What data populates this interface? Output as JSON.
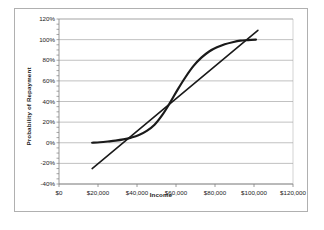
{
  "chart_data": {
    "type": "line",
    "title": "",
    "xlabel": "Income",
    "ylabel": "Probability of Repayment",
    "xlim": [
      0,
      120000
    ],
    "ylim": [
      -0.4,
      1.2
    ],
    "grid": true,
    "legend": "none",
    "x_ticks": [
      {
        "value": 0,
        "label": "$0"
      },
      {
        "value": 20000,
        "label": "$20,000"
      },
      {
        "value": 40000,
        "label": "$40,000"
      },
      {
        "value": 60000,
        "label": "$60,000"
      },
      {
        "value": 80000,
        "label": "$80,000"
      },
      {
        "value": 100000,
        "label": "$100,000"
      },
      {
        "value": 120000,
        "label": "$120,000"
      }
    ],
    "y_ticks": [
      {
        "value": 1.2,
        "label": "120%"
      },
      {
        "value": 1.0,
        "label": "100%"
      },
      {
        "value": 0.8,
        "label": "80%"
      },
      {
        "value": 0.6,
        "label": "60%"
      },
      {
        "value": 0.4,
        "label": "40%"
      },
      {
        "value": 0.2,
        "label": "20%"
      },
      {
        "value": 0.0,
        "label": "0%"
      },
      {
        "value": -0.2,
        "label": "-20%"
      },
      {
        "value": -0.4,
        "label": "-40%"
      }
    ],
    "series": [
      {
        "name": "logistic-curve",
        "type": "line",
        "color": "#1a1a1a",
        "width": 2.2,
        "x": [
          17000,
          21000,
          25000,
          29000,
          33000,
          37000,
          41000,
          45000,
          49000,
          53000,
          57000,
          61000,
          65000,
          69000,
          73000,
          77000,
          81000,
          85000,
          89000,
          93000,
          97000,
          101000
        ],
        "values": [
          0.0,
          0.005,
          0.012,
          0.02,
          0.032,
          0.05,
          0.075,
          0.115,
          0.175,
          0.27,
          0.39,
          0.52,
          0.64,
          0.745,
          0.825,
          0.885,
          0.925,
          0.955,
          0.975,
          0.99,
          0.995,
          1.0
        ]
      },
      {
        "name": "linear-fit",
        "type": "line",
        "color": "#1a1a1a",
        "width": 1.6,
        "x": [
          17000,
          102000
        ],
        "values": [
          -0.25,
          1.09
        ]
      }
    ]
  },
  "figure": {
    "background": "#ffffff",
    "border_color": "#b0b0b0",
    "plot_background": "#ffffff",
    "gridline_color": "#a6a6a6",
    "axis_color": "#808080"
  }
}
